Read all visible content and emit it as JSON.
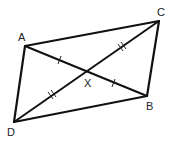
{
  "diagram": {
    "type": "parallelogram-with-diagonals",
    "vertices": {
      "A": {
        "label": "A",
        "x": 25,
        "y": 46
      },
      "B": {
        "label": "B",
        "x": 147,
        "y": 96
      },
      "C": {
        "label": "C",
        "x": 159,
        "y": 21
      },
      "D": {
        "label": "D",
        "x": 14,
        "y": 122
      }
    },
    "intersection": {
      "label": "X",
      "x": 87,
      "y": 71
    },
    "sides": [
      "AC",
      "CB",
      "BD",
      "DA"
    ],
    "diagonals": [
      "AB",
      "CD"
    ],
    "tick_marks": [
      {
        "segment": "AX",
        "count": 1
      },
      {
        "segment": "XB",
        "count": 1
      },
      {
        "segment": "CX",
        "count": 2
      },
      {
        "segment": "XD",
        "count": 2
      }
    ],
    "colors": {
      "stroke": "#111111",
      "background": "#ffffff"
    }
  }
}
